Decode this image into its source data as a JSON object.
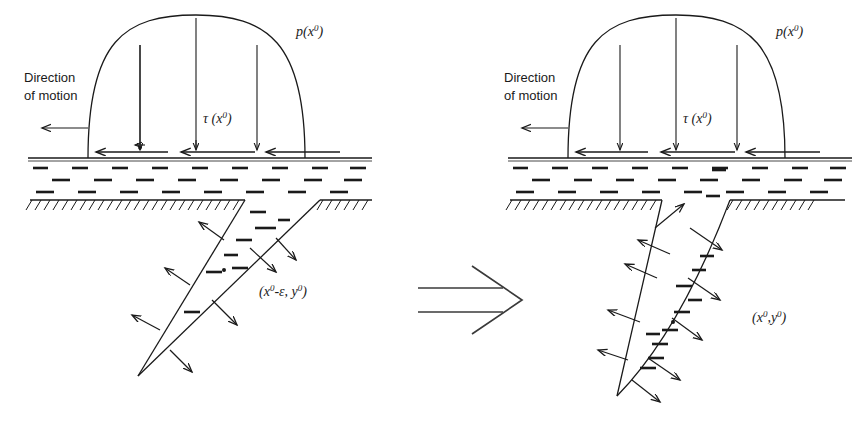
{
  "figure": {
    "background_color": "#ffffff",
    "ink_color": "#1a1a1a"
  },
  "panels": [
    {
      "id": "left",
      "name": "before-panel",
      "direction_label_line1": "Direction",
      "direction_label_line2": "of motion",
      "pressure_label": "p(x",
      "pressure_label_sup": "0",
      "pressure_label_tail": ")",
      "shear_label": "τ (x",
      "shear_label_sup": "0",
      "shear_label_tail": ")",
      "point_label_prefix": "(x",
      "point_label_sup1": "0",
      "point_label_mid": "-ε, y",
      "point_label_sup2": "0",
      "point_label_tail": ")",
      "crack_type": "narrow-v-slit"
    },
    {
      "id": "right",
      "name": "after-panel",
      "direction_label_line1": "Direction",
      "direction_label_line2": "of motion",
      "pressure_label": "p(x",
      "pressure_label_sup": "0",
      "pressure_label_tail": ")",
      "shear_label": "τ (x",
      "shear_label_sup": "0",
      "shear_label_tail": ")",
      "point_label_prefix": "(x",
      "point_label_sup1": "0",
      "point_label_mid": ",y",
      "point_label_sup2": "0",
      "point_label_tail": ")",
      "crack_type": "open-lens"
    }
  ],
  "transition": {
    "symbol_name": "implies-arrow",
    "meaning": "becomes"
  },
  "counts": {
    "pressure_arrows_per_panel": 3,
    "shear_arrows_per_panel": 3,
    "crack_face_arrows_left": 7,
    "crack_face_arrows_right": 8
  }
}
